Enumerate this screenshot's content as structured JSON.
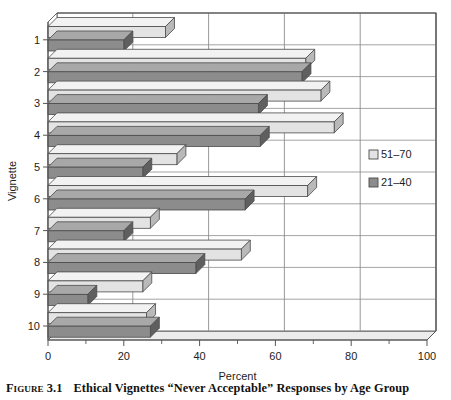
{
  "caption": {
    "figure_label": "Figure 3.1",
    "title": "Ethical Vignettes “Never Acceptable” Responses by Age Group"
  },
  "legend": {
    "position": "right-middle",
    "entries": [
      {
        "label": "51–70",
        "swatch": "#e3e3e3",
        "name": "legend-swatch-51-70"
      },
      {
        "label": "21–40",
        "swatch": "#8c8c8c",
        "name": "legend-swatch-21-40"
      }
    ]
  },
  "axes": {
    "x_title": "Percent",
    "y_title": "Vignette",
    "x_ticks": [
      "0",
      "20",
      "40",
      "60",
      "80",
      "100"
    ],
    "y_ticks": [
      "1",
      "2",
      "3",
      "4",
      "5",
      "6",
      "7",
      "8",
      "9",
      "10"
    ]
  },
  "colors": {
    "series_51_70": "#e3e3e3",
    "series_21_40": "#8c8c8c",
    "series_51_70_top": "#f2f2f2",
    "series_21_40_top": "#a8a8a8",
    "series_51_70_side": "#b9b9b9",
    "series_21_40_side": "#5f5f5f",
    "outline": "#4a4a4a",
    "grid": "#8d8d8d",
    "frame": "#555555",
    "text": "#1a1a1a"
  },
  "chart_data": {
    "type": "bar",
    "orientation": "horizontal",
    "title": "Ethical Vignettes “Never Acceptable” Responses by Age Group",
    "xlabel": "Percent",
    "ylabel": "Vignette",
    "xlim": [
      0,
      100
    ],
    "xticks": [
      0,
      20,
      40,
      60,
      80,
      100
    ],
    "grid": true,
    "legend": "right",
    "categories": [
      "1",
      "2",
      "3",
      "4",
      "5",
      "6",
      "7",
      "8",
      "9",
      "10"
    ],
    "series": [
      {
        "name": "51–70",
        "values": [
          31,
          68,
          72,
          75.5,
          34,
          68.5,
          27,
          51,
          25,
          26
        ]
      },
      {
        "name": "21–40",
        "values": [
          20,
          67,
          55.5,
          56,
          25,
          52,
          20,
          39,
          10.5,
          27
        ]
      }
    ]
  }
}
